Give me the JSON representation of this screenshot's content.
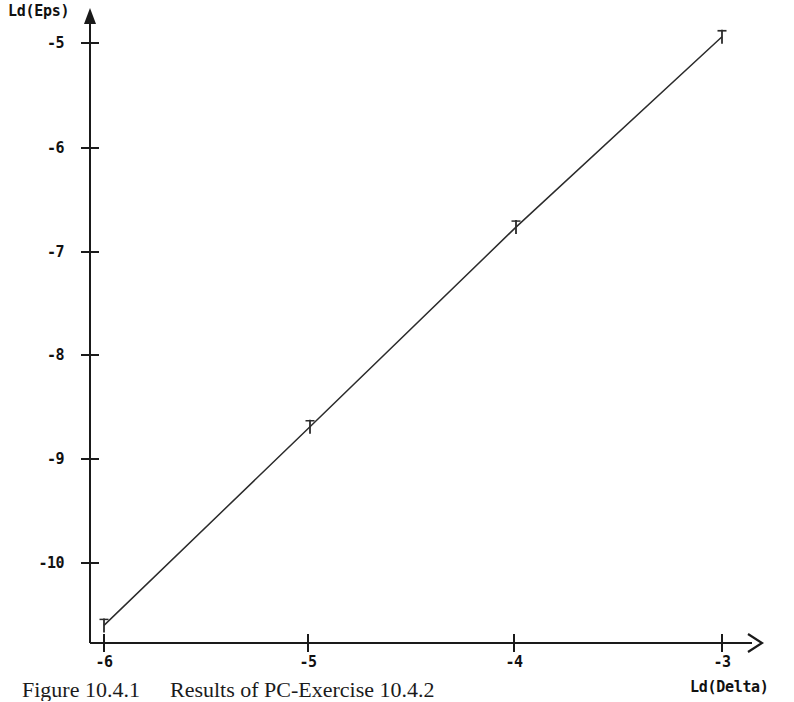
{
  "figure": {
    "caption_number": "Figure 10.4.1",
    "caption_text": "Results of PC-Exercise 10.4.2",
    "background_color": "#ffffff",
    "ink_color": "#1a1a1a"
  },
  "axes": {
    "y_title": "Ld(Eps)",
    "x_title": "Ld(Delta)",
    "y_tick_labels": [
      "-5",
      "-6",
      "-7",
      "-8",
      "-9",
      "-10"
    ],
    "x_tick_labels": [
      "-6",
      "-5",
      "-4",
      "-3"
    ],
    "y_arrow": "up-arrow-head",
    "x_arrow": "right-arrow-head"
  },
  "chart_data": {
    "type": "line",
    "title": "Results of PC-Exercise 10.4.2",
    "xlabel": "Ld(Delta)",
    "ylabel": "Ld(Eps)",
    "x": [
      -6,
      -5,
      -4,
      -3
    ],
    "values": [
      -10.6,
      -8.69,
      -6.77,
      -4.94
    ],
    "series": [
      {
        "name": "Ld(Eps)",
        "x": [
          -6,
          -5,
          -4,
          -3
        ],
        "values": [
          -10.6,
          -8.69,
          -6.77,
          -4.94
        ],
        "marker": "tick-cross",
        "line_style": "solid-thin"
      }
    ],
    "xlim": [
      -6.17,
      -2.84
    ],
    "ylim": [
      -10.77,
      -4.78
    ],
    "xticks": [
      -6,
      -5,
      -4,
      -3
    ],
    "yticks": [
      -5,
      -6,
      -7,
      -8,
      -9,
      -10
    ],
    "grid": false,
    "legend": false
  }
}
